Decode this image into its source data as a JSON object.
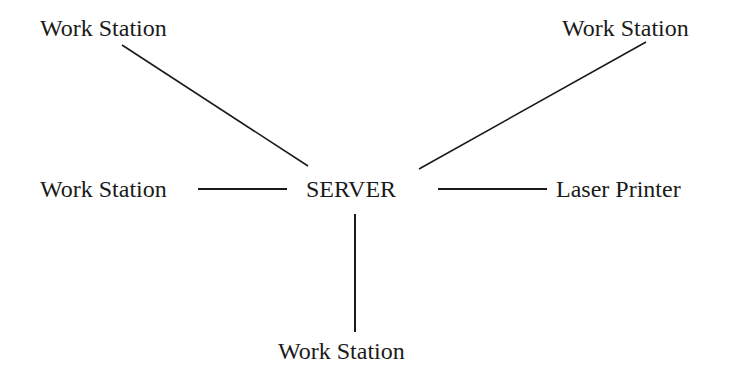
{
  "diagram": {
    "type": "network-star-topology",
    "center": {
      "label": "SERVER"
    },
    "nodes": [
      {
        "id": "ws-top-left",
        "label": "Work Station"
      },
      {
        "id": "ws-top-right",
        "label": "Work Station"
      },
      {
        "id": "ws-left",
        "label": "Work Station"
      },
      {
        "id": "printer-right",
        "label": "Laser Printer"
      },
      {
        "id": "ws-bottom",
        "label": "Work Station"
      }
    ],
    "edges": [
      {
        "from": "SERVER",
        "to": "ws-top-left"
      },
      {
        "from": "SERVER",
        "to": "ws-top-right"
      },
      {
        "from": "SERVER",
        "to": "ws-left"
      },
      {
        "from": "SERVER",
        "to": "printer-right"
      },
      {
        "from": "SERVER",
        "to": "ws-bottom"
      }
    ],
    "line_color": "#1a1a1a"
  }
}
